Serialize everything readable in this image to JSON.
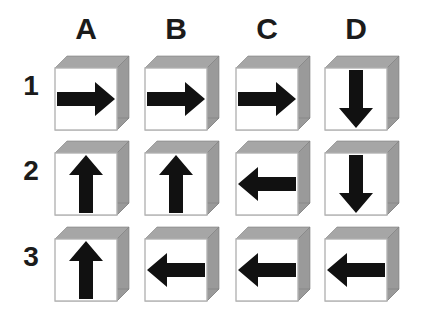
{
  "figure": {
    "type": "arrow-cube-grid",
    "background_color": "#ffffff",
    "cube_face_color": "#ffffff",
    "cube_side_color": "#9a9a9a",
    "cube_top_color": "#a6a6a6",
    "cube_edge_color": "#b4b4b4",
    "arrow_color": "#111111",
    "label_color": "#1b1b1b"
  },
  "columns": [
    {
      "id": "A",
      "label": "A",
      "x": 55
    },
    {
      "id": "B",
      "label": "B",
      "x": 145
    },
    {
      "id": "C",
      "label": "C",
      "x": 236
    },
    {
      "id": "D",
      "label": "D",
      "x": 325
    }
  ],
  "rows": [
    {
      "id": "1",
      "label": "1",
      "y": 56
    },
    {
      "id": "2",
      "label": "2",
      "y": 141
    },
    {
      "id": "3",
      "label": "3",
      "y": 227
    }
  ],
  "cells": [
    {
      "id": "A1",
      "row": "1",
      "column": "A",
      "direction": "right",
      "x": 55,
      "y": 56
    },
    {
      "id": "B1",
      "row": "1",
      "column": "B",
      "direction": "right",
      "x": 145,
      "y": 56
    },
    {
      "id": "C1",
      "row": "1",
      "column": "C",
      "direction": "right",
      "x": 236,
      "y": 56
    },
    {
      "id": "D1",
      "row": "1",
      "column": "D",
      "direction": "down",
      "x": 325,
      "y": 56
    },
    {
      "id": "A2",
      "row": "2",
      "column": "A",
      "direction": "up",
      "x": 55,
      "y": 141
    },
    {
      "id": "B2",
      "row": "2",
      "column": "B",
      "direction": "up",
      "x": 145,
      "y": 141
    },
    {
      "id": "C2",
      "row": "2",
      "column": "C",
      "direction": "left",
      "x": 236,
      "y": 141
    },
    {
      "id": "D2",
      "row": "2",
      "column": "D",
      "direction": "down",
      "x": 325,
      "y": 141
    },
    {
      "id": "A3",
      "row": "3",
      "column": "A",
      "direction": "up",
      "x": 55,
      "y": 227
    },
    {
      "id": "B3",
      "row": "3",
      "column": "B",
      "direction": "left",
      "x": 145,
      "y": 227
    },
    {
      "id": "C3",
      "row": "3",
      "column": "C",
      "direction": "left",
      "x": 236,
      "y": 227
    },
    {
      "id": "D3",
      "row": "3",
      "column": "D",
      "direction": "left",
      "x": 325,
      "y": 227
    }
  ],
  "header_y": 14,
  "row_label_x": 14
}
